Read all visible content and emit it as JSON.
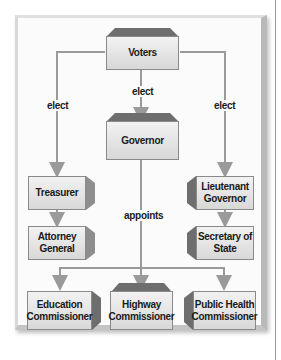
{
  "diagram": {
    "nodes": {
      "voters": "Voters",
      "governor": "Governor",
      "treasurer": "Treasurer",
      "attorney_general": "Attorney General",
      "lieutenant_governor": "Lieutenant Governor",
      "secretary_of_state": "Secretary of State",
      "education_commissioner": "Education Commissioner",
      "highway_commissioner": "Highway Commissioner",
      "public_health_commissioner": "Public Health Commissioner"
    },
    "edge_labels": {
      "elect_left": "elect",
      "elect_center": "elect",
      "elect_right": "elect",
      "appoints": "appoints"
    },
    "colors": {
      "box_fill": "#e4e4e4",
      "bevel": "#6a6a6a",
      "connector": "#9a9a9a"
    }
  }
}
